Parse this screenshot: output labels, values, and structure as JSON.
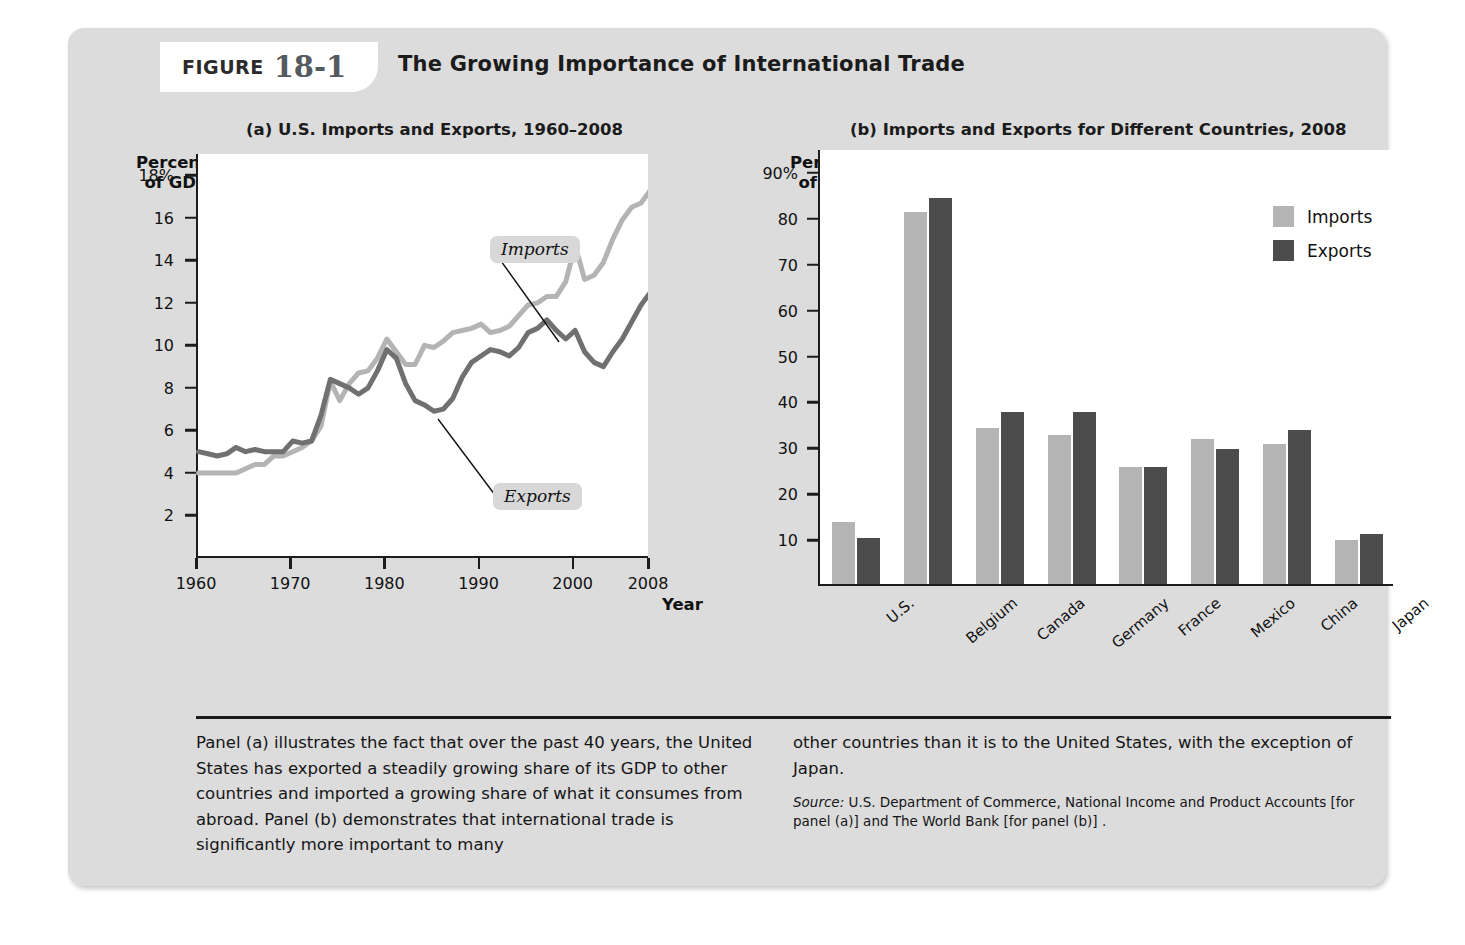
{
  "figure": {
    "label_word": "FIGURE",
    "number": "18-1",
    "title": "The Growing Importance of International Trade"
  },
  "panel_a": {
    "subtitle": "(a) U.S. Imports and Exports, 1960–2008",
    "y_axis_title": "Percent of GDP",
    "x_axis_title": "Year",
    "series_tags": {
      "imports": "Imports",
      "exports": "Exports"
    }
  },
  "panel_b": {
    "subtitle": "(b) Imports and Exports for Different Countries, 2008",
    "y_axis_title": "Percent of GDP",
    "legend": [
      {
        "label": "Imports",
        "color": "#b4b4b4"
      },
      {
        "label": "Exports",
        "color": "#4c4c4c"
      }
    ]
  },
  "caption": {
    "left": "Panel (a) illustrates the fact that over the past 40 years, the United States has exported a steadily growing share of its GDP to other countries and imported a growing share of what it consumes from abroad. Panel (b) demonstrates that international trade is significantly more important to many",
    "right": "other countries than it is to the United States, with the exception of Japan.",
    "source_word": "Source:",
    "source_text": " U.S. Department of Commerce, National Income and Product Accounts [for panel (a)] and The World Bank [for panel (b)] ."
  },
  "chart_data": [
    {
      "type": "line",
      "title": "(a) U.S. Imports and Exports, 1960–2008",
      "xlabel": "Year",
      "ylabel": "Percent of GDP",
      "xlim": [
        1960,
        2008
      ],
      "ylim": [
        0,
        19
      ],
      "ytick_labels": [
        "18%",
        "16",
        "14",
        "12",
        "10",
        "8",
        "6",
        "4",
        "2"
      ],
      "yticks": [
        18,
        16,
        14,
        12,
        10,
        8,
        6,
        4,
        2
      ],
      "xticks": [
        1960,
        1970,
        1980,
        1990,
        2000,
        2008
      ],
      "xtick_labels": [
        "1960",
        "1970",
        "1980",
        "1990",
        "2000",
        "2008"
      ],
      "grid": false,
      "legend": "inline-annotations",
      "x": [
        1960,
        1961,
        1962,
        1963,
        1964,
        1965,
        1966,
        1967,
        1968,
        1969,
        1970,
        1971,
        1972,
        1973,
        1974,
        1975,
        1976,
        1977,
        1978,
        1979,
        1980,
        1981,
        1982,
        1983,
        1984,
        1985,
        1986,
        1987,
        1988,
        1989,
        1990,
        1991,
        1992,
        1993,
        1994,
        1995,
        1996,
        1997,
        1998,
        1999,
        2000,
        2001,
        2002,
        2003,
        2004,
        2005,
        2006,
        2007,
        2008
      ],
      "series": [
        {
          "name": "Imports",
          "color": "#b4b4b4",
          "values": [
            4.0,
            4.0,
            4.0,
            4.0,
            4.0,
            4.2,
            4.4,
            4.4,
            4.8,
            4.8,
            5.0,
            5.2,
            5.5,
            6.2,
            8.3,
            7.4,
            8.2,
            8.7,
            8.8,
            9.4,
            10.3,
            9.7,
            9.1,
            9.1,
            10.0,
            9.9,
            10.2,
            10.6,
            10.7,
            10.8,
            11.0,
            10.6,
            10.7,
            10.9,
            11.4,
            11.9,
            12.0,
            12.3,
            12.3,
            13.0,
            14.7,
            13.1,
            13.3,
            13.9,
            15.0,
            15.9,
            16.5,
            16.7,
            17.3
          ]
        },
        {
          "name": "Exports",
          "color": "#707070",
          "values": [
            5.0,
            4.9,
            4.8,
            4.9,
            5.2,
            5.0,
            5.1,
            5.0,
            5.0,
            5.0,
            5.5,
            5.4,
            5.5,
            6.7,
            8.4,
            8.2,
            8.0,
            7.7,
            8.0,
            8.8,
            9.8,
            9.4,
            8.2,
            7.4,
            7.2,
            6.9,
            7.0,
            7.5,
            8.5,
            9.2,
            9.5,
            9.8,
            9.7,
            9.5,
            9.9,
            10.6,
            10.8,
            11.2,
            10.7,
            10.3,
            10.7,
            9.7,
            9.2,
            9.0,
            9.7,
            10.3,
            11.1,
            11.9,
            12.5
          ]
        }
      ]
    },
    {
      "type": "bar",
      "title": "(b) Imports and Exports for Different Countries, 2008",
      "ylabel": "Percent of GDP",
      "xlabel": "",
      "ylim": [
        0,
        95
      ],
      "yticks": [
        10,
        20,
        30,
        40,
        50,
        60,
        70,
        80,
        90
      ],
      "ytick_labels": [
        "10",
        "20",
        "30",
        "40",
        "50",
        "60",
        "70",
        "80",
        "90%"
      ],
      "grid": false,
      "legend_position": "top-right",
      "categories": [
        "U.S.",
        "Belgium",
        "Canada",
        "Germany",
        "France",
        "Mexico",
        "China",
        "Japan"
      ],
      "series": [
        {
          "name": "Imports",
          "color": "#b4b4b4",
          "values": [
            13.5,
            81,
            34,
            32.5,
            25.5,
            31.5,
            30.5,
            9.5
          ]
        },
        {
          "name": "Exports",
          "color": "#4c4c4c",
          "values": [
            10,
            84,
            37.5,
            37.5,
            25.5,
            29.5,
            33.5,
            11
          ]
        }
      ]
    }
  ]
}
